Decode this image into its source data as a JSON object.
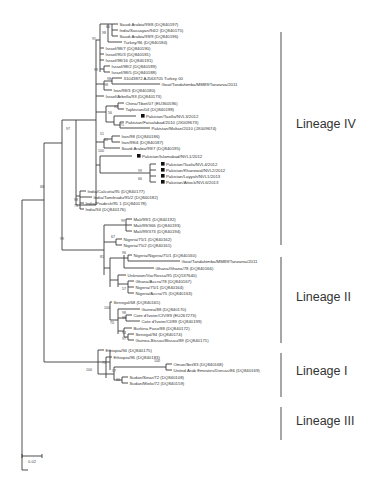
{
  "figure": {
    "type": "phylogenetic-tree",
    "scale_bar": {
      "label": "0.02"
    },
    "lineages": [
      {
        "name": "Lineage IV",
        "y1": 32,
        "y2": 245,
        "ly": 128
      },
      {
        "name": "Lineage II",
        "y1": 257,
        "y2": 343,
        "ly": 301
      },
      {
        "name": "Lineage I",
        "y1": 353,
        "y2": 397,
        "ly": 375
      },
      {
        "name": "Lineage III",
        "y1": 407,
        "y2": 440,
        "ly": 425
      }
    ],
    "leaves": [
      {
        "x": 118,
        "y": 24,
        "label": "Saudi Arabia/99/8 (DQ840197)"
      },
      {
        "x": 118,
        "y": 30,
        "label": "India/Sassayan/94/2 (DQ840175)"
      },
      {
        "x": 118,
        "y": 36,
        "label": "Saudi Arabia/99/9 (DQ840196)"
      },
      {
        "x": 122,
        "y": 42,
        "label": "Turkey/96 (DQ840184)"
      },
      {
        "x": 104,
        "y": 48,
        "label": "Israel/98/7 (DQ840190)"
      },
      {
        "x": 104,
        "y": 54,
        "label": "Israel/95/3 (DQ840181)"
      },
      {
        "x": 104,
        "y": 60,
        "label": "Israel/98/16 (DQ840191)"
      },
      {
        "x": 110,
        "y": 66,
        "label": "Israel/98/2 (DQ840189)"
      },
      {
        "x": 110,
        "y": 72,
        "label": "Israel/98/5 (DQ840188)"
      },
      {
        "x": 122,
        "y": 78,
        "label": "31043872 AJ563705 Turkey 00"
      },
      {
        "x": 160,
        "y": 84,
        "label": "Goat/Tandahimba/MM89/Tanzania/2011"
      },
      {
        "x": 112,
        "y": 90,
        "label": "Iran/98/3 (DQ840180)"
      },
      {
        "x": 104,
        "y": 96,
        "label": "Israel/Arbella/93 (DQ840173)"
      },
      {
        "x": 124,
        "y": 103,
        "label": "China/Tibet/07 (EU360596)"
      },
      {
        "x": 124,
        "y": 109,
        "label": "Tajikistan/04 (DQ840198)"
      },
      {
        "x": 140,
        "y": 116,
        "label": "Pakistan/Taxilla/NVL3/2012",
        "marker": true
      },
      {
        "x": 124,
        "y": 122,
        "label": "Pakistan/Faisalabad/2010 (JX009673)"
      },
      {
        "x": 150,
        "y": 128,
        "label": "Pakistan/Multan/2010 (JX009674)"
      },
      {
        "x": 120,
        "y": 136,
        "label": "Iran/98 (DQ840186)"
      },
      {
        "x": 120,
        "y": 142,
        "label": "Iran/98/4 (DQ840187)"
      },
      {
        "x": 120,
        "y": 148,
        "label": "Saudi Arabia/99/7 (DQ840195)"
      },
      {
        "x": 136,
        "y": 156,
        "label": "Pakistan/Islamabad/NVL1/2012",
        "marker": true
      },
      {
        "x": 160,
        "y": 164,
        "label": "Pakistan/Taxila/NVL4/2012",
        "marker": true
      },
      {
        "x": 160,
        "y": 170,
        "label": "Pakistan/Khanewal/NVL2/2012",
        "marker": true
      },
      {
        "x": 160,
        "y": 176,
        "label": "Pakistan/Layyah/NVL1/2013",
        "marker": true
      },
      {
        "x": 160,
        "y": 182,
        "label": "Pakistan/Attock/NVL6/2013",
        "marker": true
      },
      {
        "x": 86,
        "y": 191,
        "label": "India/Calcutta/95 (DQ840177)"
      },
      {
        "x": 92,
        "y": 197,
        "label": "India/Tamilnadu/95/2 (DQ840182)"
      },
      {
        "x": 84,
        "y": 203,
        "label": "India/Pradesh/95 1 (DQ840178)"
      },
      {
        "x": 84,
        "y": 209,
        "label": "India/94 (DQ840176)"
      },
      {
        "x": 132,
        "y": 219,
        "label": "Mali/99/1 (DQ840192)"
      },
      {
        "x": 132,
        "y": 225,
        "label": "Mali/99/366 (DQ840193)"
      },
      {
        "x": 132,
        "y": 231,
        "label": "Mali/99/373 (DQ840194)"
      },
      {
        "x": 122,
        "y": 239,
        "label": "Nigeria/75/1 (DQ840162)"
      },
      {
        "x": 122,
        "y": 245,
        "label": "Nigeria/75/2 (DQ840161)"
      },
      {
        "x": 132,
        "y": 255,
        "label": "Nigeria/Nigeria/75/1 (DQ840160)"
      },
      {
        "x": 180,
        "y": 261,
        "label": "Goat/Tandahimba/MM89/Tanzania/2011"
      },
      {
        "x": 154,
        "y": 268,
        "label": "Ghana/Ghana/78 (DQ840166)"
      },
      {
        "x": 126,
        "y": 275,
        "label": "Unknown/VacRossa/95 (DQ537640)"
      },
      {
        "x": 134,
        "y": 281,
        "label": "Ghana/Accra/78 (DQ840167)"
      },
      {
        "x": 134,
        "y": 287,
        "label": "Nigeria/75/1 (DQ840164)"
      },
      {
        "x": 134,
        "y": 293,
        "label": "Nigeria/Accra/75 (DQ840163)"
      },
      {
        "x": 112,
        "y": 302,
        "label": "Senegal/68 (DQ840165)"
      },
      {
        "x": 140,
        "y": 309,
        "label": "Guinea/88 (DQ840170)"
      },
      {
        "x": 132,
        "y": 315,
        "label": "Cote d'Ivoire/CIV/89 (EU267273)"
      },
      {
        "x": 140,
        "y": 321,
        "label": "Cote d'Ivoire/CI/89 (DQ840199)"
      },
      {
        "x": 132,
        "y": 328,
        "label": "Burkina Faso/88 (DQ840172)"
      },
      {
        "x": 134,
        "y": 334,
        "label": "Senegal/94 (DQ840174)"
      },
      {
        "x": 134,
        "y": 340,
        "label": "Guinea-Bissau/Bissau/89 (DQ840171)"
      },
      {
        "x": 104,
        "y": 350,
        "label": "Ethiopia/94 (DQ840175)"
      },
      {
        "x": 112,
        "y": 357,
        "label": "Ethiopia/96 (DQ840183)"
      },
      {
        "x": 172,
        "y": 364,
        "label": "Oman/Ibri/83 (DQ840168)"
      },
      {
        "x": 172,
        "y": 370,
        "label": "United Arab Emirates/Dorcas/86 (DQ840169)"
      },
      {
        "x": 128,
        "y": 377,
        "label": "Sudan/Sinar/72 (DQ840108)"
      },
      {
        "x": 128,
        "y": 383,
        "label": "Sudan/Mielo/72 (DQ840159)"
      }
    ],
    "bootstrap": [
      {
        "x": 110,
        "y": 28,
        "v": "66"
      },
      {
        "x": 106,
        "y": 34,
        "v": "98"
      },
      {
        "x": 96,
        "y": 40,
        "v": "95"
      },
      {
        "x": 98,
        "y": 71,
        "v": "99"
      },
      {
        "x": 111,
        "y": 80,
        "v": "98"
      },
      {
        "x": 108,
        "y": 86,
        "v": "98"
      },
      {
        "x": 112,
        "y": 114,
        "v": "56"
      },
      {
        "x": 118,
        "y": 108,
        "v": "92"
      },
      {
        "x": 124,
        "y": 126,
        "v": "71"
      },
      {
        "x": 104,
        "y": 135,
        "v": "51"
      },
      {
        "x": 108,
        "y": 141,
        "v": "61"
      },
      {
        "x": 104,
        "y": 152,
        "v": "100"
      },
      {
        "x": 142,
        "y": 172,
        "v": "99"
      },
      {
        "x": 142,
        "y": 180,
        "v": "66"
      },
      {
        "x": 70,
        "y": 130,
        "v": "97"
      },
      {
        "x": 78,
        "y": 201,
        "v": "98"
      },
      {
        "x": 78,
        "y": 207,
        "v": "73"
      },
      {
        "x": 125,
        "y": 222,
        "v": "99"
      },
      {
        "x": 115,
        "y": 238,
        "v": "67"
      },
      {
        "x": 64,
        "y": 240,
        "v": "99"
      },
      {
        "x": 104,
        "y": 258,
        "v": "81"
      },
      {
        "x": 126,
        "y": 254,
        "v": "96"
      },
      {
        "x": 126,
        "y": 290,
        "v": "57"
      },
      {
        "x": 44,
        "y": 188,
        "v": "68"
      },
      {
        "x": 110,
        "y": 309,
        "v": "100"
      },
      {
        "x": 126,
        "y": 314,
        "v": "98"
      },
      {
        "x": 126,
        "y": 319,
        "v": "99"
      },
      {
        "x": 114,
        "y": 324,
        "v": "70"
      },
      {
        "x": 126,
        "y": 334,
        "v": "94"
      },
      {
        "x": 126,
        "y": 340,
        "v": "97"
      },
      {
        "x": 92,
        "y": 371,
        "v": "100"
      },
      {
        "x": 106,
        "y": 364,
        "v": "71"
      },
      {
        "x": 116,
        "y": 372,
        "v": "57"
      },
      {
        "x": 120,
        "y": 381,
        "v": "66"
      },
      {
        "x": 160,
        "y": 362,
        "v": "100"
      }
    ]
  }
}
